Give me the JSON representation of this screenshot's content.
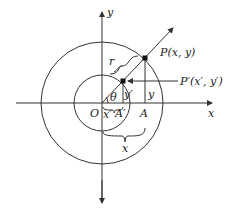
{
  "diagram": {
    "type": "polar-coordinate-scaling-figure",
    "axes": {
      "x_label": "x",
      "y_label": "y",
      "origin_label": "O"
    },
    "circles": [
      {
        "name": "outer",
        "radius_px": 61
      },
      {
        "name": "inner",
        "radius_px": 28
      }
    ],
    "points": {
      "P": "P(x, y)",
      "P_prime": "P′(x′, y′)",
      "A": "A",
      "A_prime": "A′"
    },
    "labels": {
      "r": "r",
      "theta": "θ",
      "y_outer": "y",
      "y_inner": "y′",
      "x_outer": "x",
      "x_inner": "x′"
    },
    "colors": {
      "stroke": "#333333",
      "text": "#222222",
      "point": "#111111"
    }
  }
}
